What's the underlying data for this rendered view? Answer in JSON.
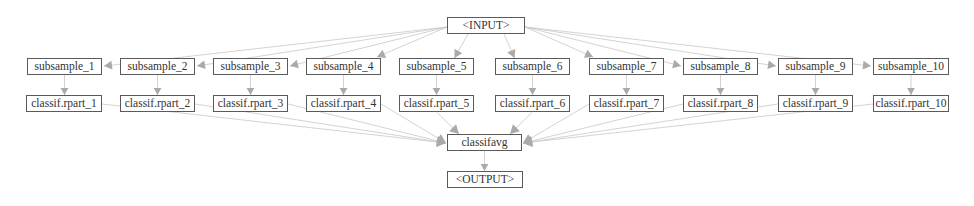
{
  "graph": {
    "edge_color": "#c8c8c8",
    "arrow_color": "#aaaaaa",
    "node_border_color": "#5a5a5a",
    "input_node": {
      "label": "<INPUT>",
      "x": 447,
      "y": 17,
      "w": 78
    },
    "subsamples": [
      {
        "label": "subsample_1",
        "x": 27,
        "y": 58,
        "w": 75
      },
      {
        "label": "subsample_2",
        "x": 120,
        "y": 58,
        "w": 75
      },
      {
        "label": "subsample_3",
        "x": 213,
        "y": 58,
        "w": 75
      },
      {
        "label": "subsample_4",
        "x": 306,
        "y": 58,
        "w": 75
      },
      {
        "label": "subsample_5",
        "x": 399,
        "y": 58,
        "w": 75
      },
      {
        "label": "subsample_6",
        "x": 495,
        "y": 58,
        "w": 75
      },
      {
        "label": "subsample_7",
        "x": 589,
        "y": 58,
        "w": 75
      },
      {
        "label": "subsample_8",
        "x": 683,
        "y": 58,
        "w": 75
      },
      {
        "label": "subsample_9",
        "x": 778,
        "y": 58,
        "w": 75
      },
      {
        "label": "subsample_10",
        "x": 873,
        "y": 58,
        "w": 76
      }
    ],
    "learners": [
      {
        "label": "classif.rpart_1",
        "x": 26,
        "y": 95,
        "w": 76
      },
      {
        "label": "classif.rpart_2",
        "x": 120,
        "y": 95,
        "w": 75
      },
      {
        "label": "classif.rpart_3",
        "x": 213,
        "y": 95,
        "w": 75
      },
      {
        "label": "classif.rpart_4",
        "x": 306,
        "y": 95,
        "w": 75
      },
      {
        "label": "classif.rpart_5",
        "x": 399,
        "y": 95,
        "w": 75
      },
      {
        "label": "classif.rpart_6",
        "x": 495,
        "y": 95,
        "w": 75
      },
      {
        "label": "classif.rpart_7",
        "x": 589,
        "y": 95,
        "w": 75
      },
      {
        "label": "classif.rpart_8",
        "x": 683,
        "y": 95,
        "w": 75
      },
      {
        "label": "classif.rpart_9",
        "x": 778,
        "y": 95,
        "w": 75
      },
      {
        "label": "classif.rpart_10",
        "x": 873,
        "y": 95,
        "w": 76
      }
    ],
    "aggregator_node": {
      "label": "classifavg",
      "x": 447,
      "y": 134,
      "w": 75
    },
    "output_node": {
      "label": "<OUTPUT>",
      "x": 447,
      "y": 171,
      "w": 76
    }
  }
}
